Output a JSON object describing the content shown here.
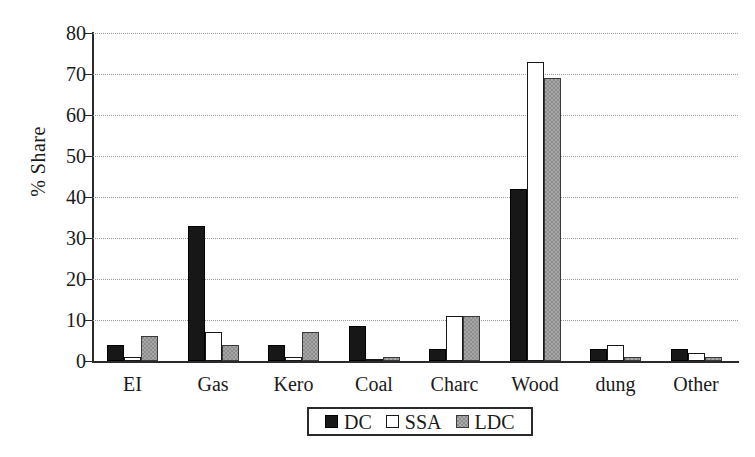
{
  "chart_data": {
    "type": "bar",
    "title": "",
    "xlabel": "",
    "ylabel": "% Share",
    "ylim": [
      0,
      80
    ],
    "yticks": [
      0,
      10,
      20,
      30,
      40,
      50,
      60,
      70,
      80
    ],
    "grid": true,
    "legend_position": "bottom-center",
    "categories": [
      "EI",
      "Gas",
      "Kero",
      "Coal",
      "Charc",
      "Wood",
      "dung",
      "Other"
    ],
    "series": [
      {
        "name": "DC",
        "color": "#171717",
        "values": [
          4,
          33,
          4,
          8.5,
          3,
          42,
          3,
          3
        ]
      },
      {
        "name": "SSA",
        "color": "#ffffff",
        "values": [
          1,
          7,
          1,
          0.5,
          11,
          73,
          4,
          2
        ]
      },
      {
        "name": "LDC",
        "color": "#8d8d8d",
        "values": [
          6,
          4,
          7,
          1,
          11,
          69,
          1,
          1
        ]
      }
    ]
  },
  "axis": {
    "y_label": "% Share",
    "y_ticks": [
      "0",
      "10",
      "20",
      "30",
      "40",
      "50",
      "60",
      "70",
      "80"
    ],
    "x_ticks": [
      "EI",
      "Gas",
      "Kero",
      "Coal",
      "Charc",
      "Wood",
      "dung",
      "Other"
    ]
  },
  "legend": {
    "items": [
      {
        "label": "DC",
        "swatch": "black-square-icon"
      },
      {
        "label": "SSA",
        "swatch": "white-square-icon"
      },
      {
        "label": "LDC",
        "swatch": "gray-square-icon"
      }
    ]
  }
}
